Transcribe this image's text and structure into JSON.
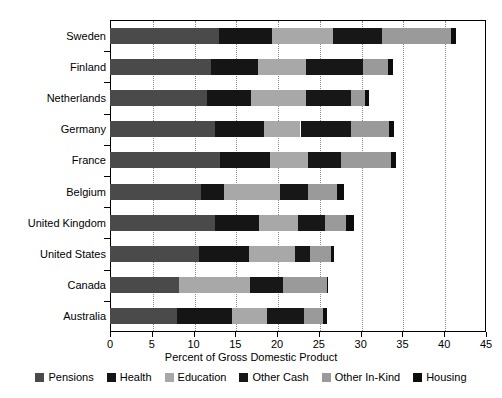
{
  "chart_data": {
    "type": "bar",
    "orientation": "horizontal",
    "stacked": true,
    "title": "",
    "subtitle": "",
    "xlabel": "Percent of Gross Domestic Product",
    "ylabel": "",
    "xlim": [
      0,
      45
    ],
    "xticks": [
      0,
      5,
      10,
      15,
      20,
      25,
      30,
      35,
      40,
      45
    ],
    "xtick_labels": [
      "0",
      "5",
      "10",
      "15",
      "20",
      "25",
      "30",
      "35",
      "40",
      "45"
    ],
    "grid": "vertical-dotted",
    "legend_position": "bottom",
    "categories": [
      "Sweden",
      "Finland",
      "Netherlands",
      "Germany",
      "France",
      "Belgium",
      "United Kingdom",
      "United States",
      "Canada",
      "Australia"
    ],
    "series": [
      {
        "name": "Pensions",
        "color": "#4a4a4a",
        "values": [
          13.0,
          12.1,
          11.6,
          12.6,
          13.2,
          10.9,
          12.6,
          10.6,
          8.2,
          8.0
        ]
      },
      {
        "name": "Health",
        "color": "#151515",
        "values": [
          6.4,
          5.6,
          5.3,
          5.8,
          5.9,
          2.8,
          5.2,
          6.0,
          0.0,
          6.6
        ]
      },
      {
        "name": "Education",
        "color": "#a8a8a8",
        "values": [
          7.3,
          5.8,
          6.5,
          4.4,
          4.6,
          6.7,
          4.7,
          5.6,
          8.6,
          4.2
        ]
      },
      {
        "name": "Other Cash",
        "color": "#171717",
        "values": [
          5.8,
          6.8,
          5.4,
          6.1,
          4.0,
          3.3,
          3.2,
          1.7,
          3.9,
          4.4
        ]
      },
      {
        "name": "Other In-Kind",
        "color": "#9a9a9a",
        "values": [
          8.3,
          3.0,
          1.7,
          4.5,
          5.9,
          3.5,
          2.5,
          2.5,
          5.3,
          2.3
        ]
      },
      {
        "name": "Housing",
        "color": "#0d0d0d",
        "values": [
          0.6,
          0.6,
          0.5,
          0.6,
          0.6,
          0.8,
          1.0,
          0.4,
          0.1,
          0.5
        ]
      }
    ],
    "totals": [
      41.4,
      33.9,
      31.0,
      34.0,
      34.2,
      28.0,
      29.2,
      26.8,
      26.1,
      26.0
    ]
  },
  "legend": {
    "items": [
      {
        "label": "Pensions",
        "color": "#4a4a4a"
      },
      {
        "label": "Health",
        "color": "#151515"
      },
      {
        "label": "Education",
        "color": "#a8a8a8"
      },
      {
        "label": "Other Cash",
        "color": "#171717"
      },
      {
        "label": "Other In-Kind",
        "color": "#9a9a9a"
      },
      {
        "label": "Housing",
        "color": "#0d0d0d"
      }
    ]
  },
  "axis": {
    "x_title": "Percent of Gross Domestic Product"
  },
  "colors": {
    "axis": "#000000",
    "grid": "#8a8a8a",
    "background": "#ffffff",
    "text": "#000000"
  }
}
